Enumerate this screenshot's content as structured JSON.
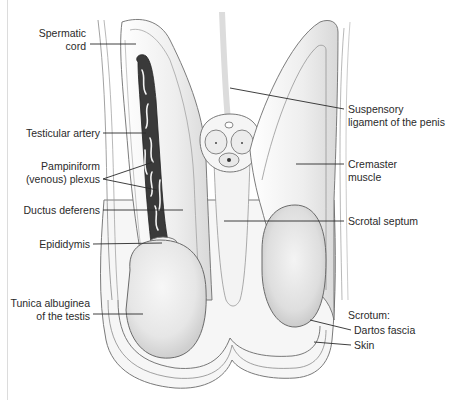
{
  "figure": {
    "labels_left": [
      {
        "id": "spermatic-cord",
        "lines": [
          "Spermatic",
          "cord"
        ]
      },
      {
        "id": "testicular-artery",
        "lines": [
          "Testicular artery"
        ]
      },
      {
        "id": "pampiniform-plexus",
        "lines": [
          "Pampiniform",
          "(venous) plexus"
        ]
      },
      {
        "id": "ductus-deferens",
        "lines": [
          "Ductus deferens"
        ]
      },
      {
        "id": "epididymis",
        "lines": [
          "Epididymis"
        ]
      },
      {
        "id": "tunica-albuginea",
        "lines": [
          "Tunica albuginea",
          "of the testis"
        ]
      }
    ],
    "labels_right": [
      {
        "id": "suspensory-ligament",
        "lines": [
          "Suspensory",
          "ligament of the penis"
        ]
      },
      {
        "id": "cremaster-muscle",
        "lines": [
          "Cremaster",
          "muscle"
        ]
      },
      {
        "id": "scrotal-septum",
        "lines": [
          "Scrotal septum"
        ]
      },
      {
        "id": "scrotum",
        "lines": [
          "Scrotum:"
        ]
      },
      {
        "id": "dartos-fascia",
        "lines": [
          "Dartos fascia"
        ]
      },
      {
        "id": "skin",
        "lines": [
          "Skin"
        ]
      }
    ]
  },
  "colors": {
    "background": "#ffffff",
    "outline": "#5a5a5a",
    "leader": "#2a2a2a",
    "tissue_light": "#f1f1f1",
    "tissue_mid": "#e2e2e2",
    "testis_fill": "#e9e9e9",
    "plexus_dark": "#2e2e2e"
  }
}
